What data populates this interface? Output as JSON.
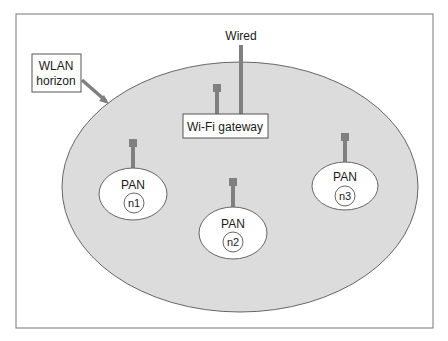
{
  "labels": {
    "wired": "Wired",
    "wlan_line1": "WLAN",
    "wlan_line2": "horizon",
    "gateway": "Wi-Fi gateway"
  },
  "pans": [
    {
      "label": "PAN",
      "node": "n1"
    },
    {
      "label": "PAN",
      "node": "n2"
    },
    {
      "label": "PAN",
      "node": "n3"
    }
  ],
  "colors": {
    "wlan_fill": "#dcdcdc",
    "stroke": "#666666",
    "antenna": "#808080",
    "frame": "#777777"
  }
}
